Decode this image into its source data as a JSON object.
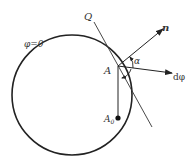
{
  "diagram": {
    "type": "geometry",
    "colors": {
      "stroke": "#222222",
      "text": "#333333",
      "background": "#ffffff"
    },
    "labels": {
      "phi_zero": "φ=0",
      "Q": "Q",
      "n": "n",
      "alpha": "α",
      "A": "A",
      "d_phi": "dφ",
      "A0_base": "A",
      "A0_sub": "0"
    },
    "elements": {
      "circle": {
        "cx": 72,
        "cy": 95,
        "r": 60
      },
      "point_A": {
        "x": 118,
        "y": 66
      },
      "point_A0": {
        "x": 118,
        "y": 118
      },
      "line_Q": {
        "from": [
          94,
          22
        ],
        "to": [
          152,
          127
        ]
      },
      "vector_n": {
        "from": [
          118,
          66
        ],
        "to": [
          163,
          29
        ]
      },
      "vector_dphi": {
        "from": [
          118,
          66
        ],
        "to": [
          172,
          73
        ]
      },
      "segment_A_A0": {
        "from": [
          118,
          66
        ],
        "to": [
          118,
          118
        ]
      }
    }
  }
}
